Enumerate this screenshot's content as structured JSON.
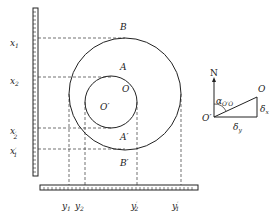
{
  "diagram": {
    "title": "",
    "vertical_scale_labels": [
      {
        "base": "x",
        "sub": "1",
        "prime": false
      },
      {
        "base": "x",
        "sub": "2",
        "prime": false
      },
      {
        "base": "x",
        "sub": "2",
        "prime": true
      },
      {
        "base": "x",
        "sub": "1",
        "prime": true
      }
    ],
    "horizontal_scale_labels": [
      {
        "base": "y",
        "sub": "1",
        "prime": false
      },
      {
        "base": "y",
        "sub": "2",
        "prime": false
      },
      {
        "base": "y",
        "sub": "2",
        "prime": true
      },
      {
        "base": "y",
        "sub": "1",
        "prime": true
      }
    ],
    "points": {
      "B": "B",
      "A": "A",
      "O": "O",
      "O_prime": "O′",
      "A_prime": "A′",
      "B_prime": "B′"
    },
    "inset": {
      "north": "N",
      "angle": "α",
      "angle_sub": "O′O",
      "origin": "O′",
      "point": "O",
      "delta_x": "δ",
      "delta_x_sub": "x",
      "delta_y": "δ",
      "delta_y_sub": "y"
    },
    "colors": {
      "stroke": "#222222",
      "background": "#ffffff"
    }
  }
}
